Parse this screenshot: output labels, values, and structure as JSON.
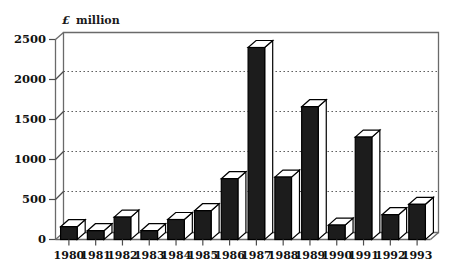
{
  "chart_data": {
    "type": "bar",
    "title": "",
    "subtitle": "",
    "xlabel": "",
    "ylabel": "£ million",
    "ylabel_symbol": "£",
    "ylabel_word": "million",
    "categories": [
      "1980",
      "1981",
      "1982",
      "1983",
      "1984",
      "1985",
      "1986",
      "1987",
      "1988",
      "1989",
      "1990",
      "1991",
      "1992",
      "1993"
    ],
    "values": [
      160,
      110,
      280,
      110,
      250,
      360,
      760,
      2400,
      780,
      1660,
      180,
      1280,
      310,
      440
    ],
    "series": [
      {
        "name": "",
        "values": [
          160,
          110,
          280,
          110,
          250,
          360,
          760,
          2400,
          780,
          1660,
          180,
          1280,
          310,
          440
        ]
      }
    ],
    "ylim": [
      0,
      2500
    ],
    "yticks": [
      0,
      500,
      1000,
      1500,
      2000,
      2500
    ],
    "ytick_labels": [
      "0",
      "500",
      "1000",
      "1500",
      "2000",
      "2500"
    ],
    "xtick_labels": [
      "1980",
      "1981",
      "1982",
      "1983",
      "1984",
      "1985",
      "1986",
      "1987",
      "1988",
      "1989",
      "1990",
      "1991",
      "1992",
      "1993"
    ],
    "grid": true,
    "grid_style": "dotted-horizontal",
    "legend": false,
    "legend_position": "none",
    "annotations": [],
    "style": {
      "three_d": true,
      "bar_fill": "#1c1c1c",
      "bar_top_fill": "#ffffff",
      "bar_side_fill": "#ffffff",
      "bar_edge": "#000000",
      "axis_color": "#555555",
      "grid_color": "#555555",
      "background": "#ffffff"
    }
  }
}
